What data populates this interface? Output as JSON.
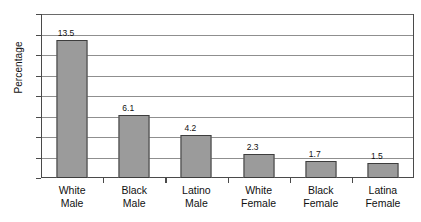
{
  "chart_data": {
    "type": "bar",
    "title": "",
    "xlabel": "",
    "ylabel": "Percentage",
    "ylim": [
      0,
      16
    ],
    "ytick_step": 2,
    "yticks": [
      16,
      14,
      12,
      10,
      8,
      6,
      4,
      2,
      0
    ],
    "grid": true,
    "grid_axis": "y",
    "legend": false,
    "categories": [
      "White Male",
      "Black Male",
      "Latino Male",
      "White Female",
      "Black Female",
      "Latina Female"
    ],
    "category_lines": [
      {
        "line1": "White",
        "line2": "Male"
      },
      {
        "line1": "Black",
        "line2": "Male"
      },
      {
        "line1": "Latino",
        "line2": "Male"
      },
      {
        "line1": "White",
        "line2": "Female"
      },
      {
        "line1": "Black",
        "line2": "Female"
      },
      {
        "line1": "Latina",
        "line2": "Female"
      }
    ],
    "values": [
      13.5,
      6.1,
      4.2,
      2.3,
      1.7,
      1.5
    ],
    "value_labels": [
      "13.5",
      "6.1",
      "4.2",
      "2.3",
      "1.7",
      "1.5"
    ],
    "colors": {
      "bar_fill": "#9b9b9b",
      "bar_border": "#3d3d3d",
      "gridline": "#8f8f8f",
      "axis": "#4a4a4a",
      "background": "#ffffff",
      "text": "#111111"
    }
  }
}
